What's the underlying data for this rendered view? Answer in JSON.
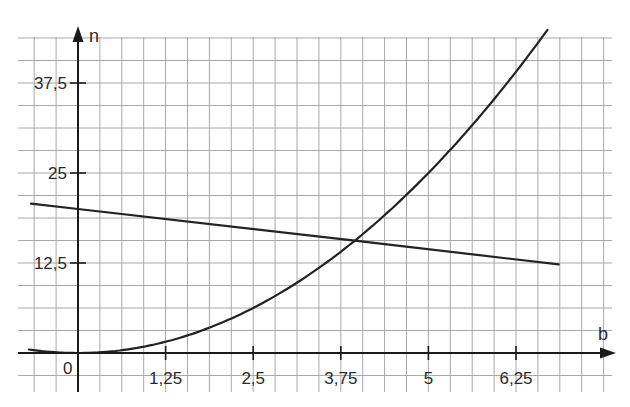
{
  "chart_data": {
    "type": "line",
    "title": "",
    "xlabel": "b",
    "ylabel": "n",
    "x_ticks": [
      {
        "value": 1.25,
        "label": "1,25"
      },
      {
        "value": 2.5,
        "label": "2,5"
      },
      {
        "value": 3.75,
        "label": "3,75"
      },
      {
        "value": 5,
        "label": "5"
      },
      {
        "value": 6.25,
        "label": "6,25"
      }
    ],
    "y_ticks": [
      {
        "value": 12.5,
        "label": "12,5"
      },
      {
        "value": 25,
        "label": "25"
      },
      {
        "value": 37.5,
        "label": "37,5"
      }
    ],
    "origin_label": "0",
    "xlim": [
      -0.85,
      7.6
    ],
    "ylim": [
      -5.5,
      43.75
    ],
    "grid": true,
    "grid_step_x": 0.3125,
    "grid_step_y": 3.125,
    "legend": null,
    "series": [
      {
        "name": "parabola",
        "formula": "n = b^2",
        "x": [
          -0.7,
          -0.5,
          0,
          0.5,
          1,
          1.5,
          2,
          2.5,
          3,
          3.5,
          3.95,
          4.5,
          5,
          5.5,
          6,
          6.5,
          6.7
        ],
        "y": [
          0.49,
          0.25,
          0,
          0.25,
          1,
          2.25,
          4,
          6.25,
          9,
          12.25,
          15.6,
          20.25,
          25,
          30.25,
          36,
          42.25,
          44.9
        ]
      },
      {
        "name": "straight line",
        "formula": "n = 20 - 1.12 b",
        "x": [
          -0.67,
          0,
          3.95,
          6.86
        ],
        "y": [
          20.75,
          20,
          15.6,
          12.3
        ]
      }
    ],
    "annotations": [
      {
        "type": "intersection",
        "x": 3.95,
        "y": 15.6
      }
    ]
  },
  "axes": {
    "x_name": "b",
    "y_name": "n",
    "origin": "0"
  }
}
